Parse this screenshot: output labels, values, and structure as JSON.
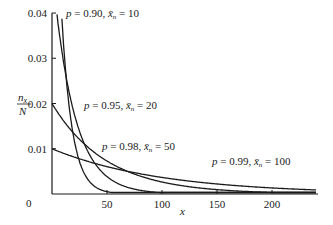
{
  "chart_data": {
    "type": "line",
    "title": "",
    "xlabel": "x",
    "ylabel": "n_x / N",
    "xlim": [
      0,
      240
    ],
    "ylim": [
      0,
      0.04
    ],
    "x_ticks": [
      0,
      50,
      100,
      150,
      200
    ],
    "y_ticks": [
      0.01,
      0.02,
      0.03,
      0.04
    ],
    "x_tick_labels": [
      "0",
      "50",
      "100",
      "150",
      "200"
    ],
    "y_tick_labels": [
      "0.01",
      "0.02",
      "0.03",
      "0.04"
    ],
    "grid": false,
    "legend": "inline labels",
    "formula": "n_x/N = (1 - p) p^x",
    "series": [
      {
        "name": "p = 0.90, x̄n = 10",
        "p": 0.9,
        "mean": 10,
        "label": {
          "p": "0.90",
          "mean": "10"
        }
      },
      {
        "name": "p = 0.95, x̄n = 20",
        "p": 0.95,
        "mean": 20,
        "label": {
          "p": "0.95",
          "mean": "20"
        }
      },
      {
        "name": "p = 0.98, x̄n = 50",
        "p": 0.98,
        "mean": 50,
        "label": {
          "p": "0.98",
          "mean": "50"
        }
      },
      {
        "name": "p = 0.99, x̄n = 100",
        "p": 0.99,
        "mean": 100,
        "label": {
          "p": "0.99",
          "mean": "100"
        }
      }
    ],
    "sample_points": {
      "x": [
        0,
        10,
        20,
        30,
        50,
        75,
        100,
        150,
        200,
        240
      ],
      "p_0.90": [
        0.1,
        0.0349,
        0.0122,
        0.0042,
        0.0005,
        0.0,
        0.0,
        0.0,
        0.0,
        0.0
      ],
      "p_0.95": [
        0.05,
        0.0299,
        0.0179,
        0.0107,
        0.0038,
        0.0011,
        0.0003,
        0.0,
        0.0,
        0.0
      ],
      "p_0.98": [
        0.02,
        0.0163,
        0.0134,
        0.0109,
        0.0073,
        0.0044,
        0.0027,
        0.001,
        0.0004,
        0.0002
      ],
      "p_0.99": [
        0.01,
        0.009,
        0.0082,
        0.0074,
        0.0061,
        0.0047,
        0.0037,
        0.0022,
        0.0013,
        0.0009
      ]
    }
  },
  "labels": {
    "y_axis_num": "n",
    "y_axis_sub": "x",
    "y_axis_den": "N",
    "x_axis": "x",
    "origin": "0",
    "p_prefix": "p",
    "eq": " = ",
    "sep": ", ",
    "mean_symbol": "x̄",
    "mean_sub": "n"
  }
}
